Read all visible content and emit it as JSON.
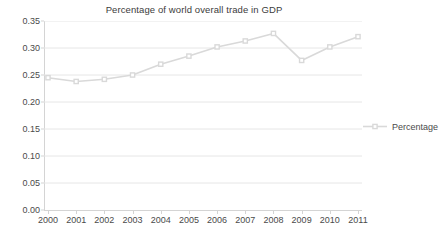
{
  "chart_data": {
    "type": "line",
    "title": "Percentage of world overall trade in GDP",
    "xlabel": "",
    "ylabel": "",
    "categories": [
      "2000",
      "2001",
      "2002",
      "2003",
      "2004",
      "2005",
      "2006",
      "2007",
      "2008",
      "2009",
      "2010",
      "2011"
    ],
    "series": [
      {
        "name": "Percentage",
        "values": [
          0.245,
          0.238,
          0.242,
          0.25,
          0.27,
          0.285,
          0.302,
          0.313,
          0.327,
          0.277,
          0.302,
          0.321
        ],
        "color": "#d9d9d9",
        "marker": "square"
      }
    ],
    "ylim": [
      0.0,
      0.35
    ],
    "y_ticks": [
      "0.00",
      "0.05",
      "0.10",
      "0.15",
      "0.20",
      "0.25",
      "0.30",
      "0.35"
    ],
    "y_tick_values": [
      0.0,
      0.05,
      0.1,
      0.15,
      0.2,
      0.25,
      0.3,
      0.35
    ],
    "grid": true,
    "grid_color": "#e6e6e6",
    "axis_color": "#d4d4d4",
    "legend_position": "right",
    "legend_entries": [
      "Percentage"
    ]
  }
}
